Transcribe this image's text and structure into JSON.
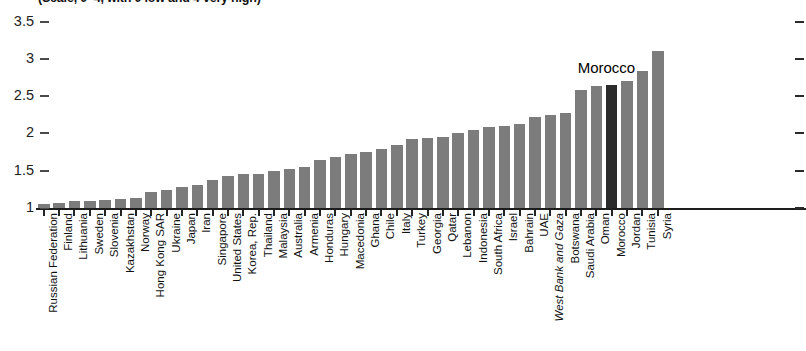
{
  "chart_data": {
    "type": "bar",
    "title": "(Scale, 0–4, with 0 low and 4 very high)",
    "xlabel": "",
    "ylabel": "",
    "ylim": [
      1,
      3.5
    ],
    "grid": false,
    "legend": "none",
    "ytick_labels": [
      "1",
      "1.5",
      "2",
      "2.5",
      "3",
      "3.5"
    ],
    "ytick_values": [
      1,
      1.5,
      2,
      2.5,
      3,
      3.5
    ],
    "annotations": [
      {
        "text": "Morocco",
        "category": "Morocco"
      }
    ],
    "highlight_category": "Morocco",
    "categories": [
      "Russian Federation",
      "Finland",
      "Lithuania",
      "Sweden",
      "Slovenia",
      "Kazakhstan",
      "Norway",
      "Hong Kong SAR",
      "Ukraine",
      "Japan",
      "Iran",
      "Singapore",
      "United States",
      "Korea, Rep.",
      "Thailand",
      "Malaysia",
      "Australia",
      "Armenia",
      "Honduras",
      "Hungary",
      "Macedonia",
      "Ghana",
      "Chile",
      "Italy",
      "Turkey",
      "Georgia",
      "Qatar",
      "Lebanon",
      "Indonesia",
      "South Africa",
      "Israel",
      "Bahrain",
      "UAE",
      "West Bank and Gaza",
      "Botswana",
      "Saudi Arabia",
      "Oman",
      "Morocco",
      "Jordan",
      "Tunisia",
      "Syria"
    ],
    "values": [
      1.05,
      1.07,
      1.09,
      1.1,
      1.11,
      1.12,
      1.14,
      1.22,
      1.24,
      1.28,
      1.31,
      1.38,
      1.43,
      1.45,
      1.46,
      1.5,
      1.52,
      1.55,
      1.64,
      1.68,
      1.72,
      1.75,
      1.79,
      1.84,
      1.92,
      1.94,
      1.95,
      2.0,
      2.04,
      2.09,
      2.1,
      2.12,
      2.22,
      2.25,
      2.27,
      2.58,
      2.63,
      2.65,
      2.7,
      2.84,
      3.1
    ],
    "italic_categories": [
      "West Bank and Gaza"
    ],
    "colors": {
      "bar": "#7c7c7c",
      "bar_highlight": "#2b2b2b",
      "axis": "#1d1d1d",
      "text": "#111111"
    }
  }
}
